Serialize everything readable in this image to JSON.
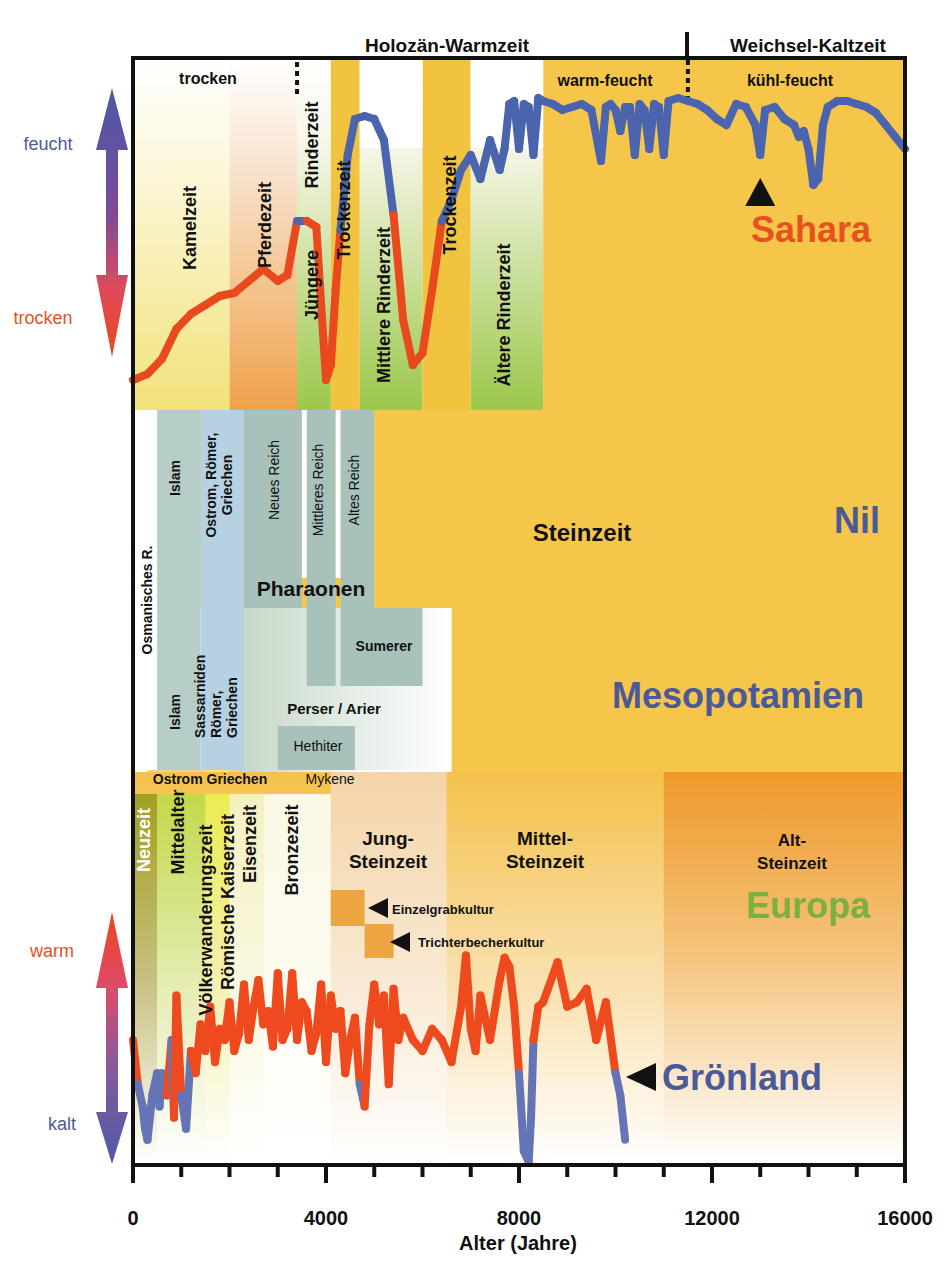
{
  "chart_data": {
    "type": "line",
    "title": "",
    "xlabel": "Alter (Jahre)",
    "xlim": [
      0,
      16000
    ],
    "xticks": [
      0,
      4000,
      8000,
      12000,
      16000
    ],
    "xminor_step": 1000,
    "period_headers": [
      {
        "label": "Holozän-Warmzeit",
        "from": 0,
        "to": 11500
      },
      {
        "label": "Weichsel-Kaltzeit",
        "from": 11500,
        "to": 16000
      }
    ],
    "climate_phases": [
      {
        "label": "trocken",
        "from": 0,
        "to": 3400
      },
      {
        "label": "warm-feucht",
        "from": 8400,
        "to": 11500
      },
      {
        "label": "kühl-feucht",
        "from": 11500,
        "to": 16000
      }
    ],
    "sahara": {
      "label": "Sahara",
      "axis_top": "feucht",
      "axis_bottom": "trocken",
      "periods": [
        {
          "label": "Kamelzeit",
          "from": 0,
          "to": 2000,
          "fill": "#f2e27a"
        },
        {
          "label": "Pferdezeit",
          "from": 2000,
          "to": 3400,
          "fill": "#efa24a"
        },
        {
          "label": "Jüngere",
          "from": 3400,
          "to": 4100,
          "fill": "#9cc84a"
        },
        {
          "label": "Rinderzeit",
          "from": 3400,
          "to": 4100,
          "fill": "#9cc84a"
        },
        {
          "label": "Trockenzeit",
          "from": 4100,
          "to": 4700,
          "fill": "#f2c33e"
        },
        {
          "label": "Mittlere Rinderzeit",
          "from": 4700,
          "to": 6000,
          "fill": "#9cc84a"
        },
        {
          "label": "Trockenzeit",
          "from": 6000,
          "to": 7000,
          "fill": "#f2c33e"
        },
        {
          "label": "Ältere Rinderzeit",
          "from": 7000,
          "to": 8500,
          "fill": "#9cc84a"
        }
      ],
      "moisture_index": {
        "x": [
          0,
          300,
          600,
          900,
          1200,
          1500,
          1800,
          2100,
          2400,
          2700,
          3000,
          3200,
          3400,
          3600,
          3800,
          3900,
          4000,
          4100,
          4200,
          4300,
          4450,
          4600,
          4800,
          5000,
          5200,
          5400,
          5600,
          5800,
          6000,
          6200,
          6400,
          6600,
          6800,
          7000,
          7200,
          7400,
          7600,
          7700,
          7800,
          7900,
          8000,
          8100,
          8200,
          8300,
          8400,
          8500,
          8700,
          8900,
          9100,
          9300,
          9500,
          9700,
          9800,
          9900,
          10000,
          10100,
          10200,
          10300,
          10400,
          10500,
          10600,
          10700,
          10800,
          10900,
          11000,
          11100,
          11300,
          11500,
          11700,
          11900,
          12100,
          12300,
          12500,
          12700,
          12900,
          13000,
          13100,
          13300,
          13500,
          13700,
          13800,
          13900,
          14000,
          14100,
          14200,
          14300,
          14400,
          14600,
          14800,
          15000,
          15200,
          15400,
          15600,
          15800,
          16000
        ],
        "y": [
          0.05,
          0.07,
          0.12,
          0.22,
          0.27,
          0.3,
          0.33,
          0.34,
          0.38,
          0.42,
          0.38,
          0.4,
          0.58,
          0.58,
          0.56,
          0.3,
          0.05,
          0.1,
          0.35,
          0.55,
          0.8,
          0.92,
          0.93,
          0.92,
          0.85,
          0.6,
          0.25,
          0.1,
          0.14,
          0.35,
          0.58,
          0.65,
          0.75,
          0.8,
          0.72,
          0.85,
          0.75,
          0.82,
          0.97,
          0.98,
          0.82,
          0.97,
          0.96,
          0.8,
          0.99,
          0.98,
          0.97,
          0.95,
          0.96,
          0.97,
          0.95,
          0.78,
          0.96,
          0.97,
          0.95,
          0.88,
          0.96,
          0.96,
          0.8,
          0.97,
          0.95,
          0.82,
          0.97,
          0.96,
          0.8,
          0.98,
          0.99,
          0.98,
          0.97,
          0.95,
          0.92,
          0.9,
          0.97,
          0.96,
          0.9,
          0.8,
          0.95,
          0.96,
          0.92,
          0.9,
          0.86,
          0.88,
          0.82,
          0.7,
          0.72,
          0.9,
          0.96,
          0.98,
          0.98,
          0.97,
          0.96,
          0.94,
          0.9,
          0.86,
          0.82
        ]
      },
      "wet_threshold": 0.58,
      "marker_at": 13000
    },
    "nil": {
      "label": "Nil",
      "background_label": "Steinzeit",
      "blocks": [
        {
          "label": "Osmanisches R.",
          "from": 0,
          "to": 500,
          "fill": "#ffffff"
        },
        {
          "label": "Islam",
          "from": 500,
          "to": 1400,
          "fill": "#b7cdc8"
        },
        {
          "label": "Ostrom, Römer, Griechen",
          "from": 1400,
          "to": 2300,
          "fill": "#b5d1e2"
        },
        {
          "label": "Neues Reich",
          "from": 2300,
          "to": 3500,
          "fill": "#a8c2bb"
        },
        {
          "label": "Mittleres Reich",
          "from": 3600,
          "to": 4200,
          "fill": "#a8c2bb"
        },
        {
          "label": "Altes Reich",
          "from": 4300,
          "to": 5000,
          "fill": "#a8c2bb"
        }
      ],
      "group_label": "Pharaonen"
    },
    "mesopotamien": {
      "label": "Mesopotamien",
      "blocks": [
        {
          "label": "Islam",
          "from": 500,
          "to": 1400
        },
        {
          "label": "Sassarniden Römer, Griechen",
          "from": 1400,
          "to": 2300
        },
        {
          "label": "Perser / Arier",
          "from": 2300,
          "to": 4000
        },
        {
          "label": "Hethiter",
          "from": 3000,
          "to": 4300
        },
        {
          "label": "Sumerer",
          "from": 4300,
          "to": 6000
        },
        {
          "label": "Ostrom Griechen",
          "from": 400,
          "to": 3000
        },
        {
          "label": "Mykene",
          "from": 3000,
          "to": 4700
        }
      ]
    },
    "europa": {
      "label": "Europa",
      "periods": [
        {
          "label": "Neuzeit",
          "from": 0,
          "to": 500
        },
        {
          "label": "Mittelalter",
          "from": 500,
          "to": 1500
        },
        {
          "label": "Völkerwanderungszeit",
          "from": 1500,
          "to": 1700
        },
        {
          "label": "Römische Kaiserzeit",
          "from": 1700,
          "to": 2000
        },
        {
          "label": "Eisenzeit",
          "from": 2000,
          "to": 2700
        },
        {
          "label": "Bronzezeit",
          "from": 2700,
          "to": 4100
        },
        {
          "label": "Jung-Steinzeit",
          "from": 4100,
          "to": 6500
        },
        {
          "label": "Mittel-Steinzeit",
          "from": 6500,
          "to": 11000
        },
        {
          "label": "Alt-Steinzeit",
          "from": 11000,
          "to": 16000
        }
      ],
      "cultures": [
        {
          "label": "Einzelgrabkultur",
          "from": 4100,
          "to": 4800
        },
        {
          "label": "Trichterbecherkultur",
          "from": 4800,
          "to": 5400
        }
      ]
    },
    "groenland": {
      "label": "Grönland",
      "axis_top": "warm",
      "axis_bottom": "kalt",
      "temperature_index": {
        "x": [
          0,
          100,
          200,
          250,
          300,
          400,
          500,
          550,
          600,
          700,
          800,
          850,
          900,
          1000,
          1100,
          1200,
          1300,
          1400,
          1500,
          1600,
          1700,
          1800,
          1900,
          2000,
          2100,
          2200,
          2300,
          2400,
          2500,
          2600,
          2700,
          2800,
          2900,
          3000,
          3100,
          3200,
          3300,
          3400,
          3500,
          3600,
          3700,
          3800,
          3900,
          4000,
          4100,
          4200,
          4300,
          4400,
          4500,
          4600,
          4700,
          4800,
          4900,
          5000,
          5100,
          5200,
          5300,
          5400,
          5500,
          5600,
          5800,
          6000,
          6200,
          6400,
          6600,
          6800,
          6900,
          7000,
          7100,
          7200,
          7400,
          7600,
          7700,
          7800,
          7900,
          8000,
          8100,
          8200,
          8250,
          8300,
          8400,
          8500,
          8600,
          8800,
          9000,
          9200,
          9400,
          9600,
          9800,
          10000,
          10100,
          10200
        ],
        "y": [
          0.55,
          0.35,
          0.25,
          0.15,
          0.1,
          0.3,
          0.4,
          0.25,
          0.4,
          0.3,
          0.55,
          0.2,
          0.75,
          0.3,
          0.15,
          0.5,
          0.4,
          0.62,
          0.5,
          0.7,
          0.45,
          0.6,
          0.55,
          0.72,
          0.5,
          0.58,
          0.8,
          0.55,
          0.7,
          0.82,
          0.62,
          0.68,
          0.52,
          0.85,
          0.55,
          0.6,
          0.85,
          0.55,
          0.72,
          0.68,
          0.5,
          0.58,
          0.8,
          0.45,
          0.75,
          0.6,
          0.68,
          0.4,
          0.55,
          0.65,
          0.35,
          0.25,
          0.62,
          0.8,
          0.62,
          0.75,
          0.35,
          0.78,
          0.55,
          0.65,
          0.55,
          0.5,
          0.6,
          0.55,
          0.45,
          0.7,
          0.93,
          0.6,
          0.5,
          0.75,
          0.55,
          0.82,
          0.92,
          0.88,
          0.7,
          0.4,
          0.05,
          0.0,
          0.2,
          0.55,
          0.7,
          0.72,
          0.78,
          0.9,
          0.7,
          0.72,
          0.78,
          0.55,
          0.72,
          0.4,
          0.3,
          0.1
        ],
        "cold_threshold": 0.4
      }
    }
  }
}
